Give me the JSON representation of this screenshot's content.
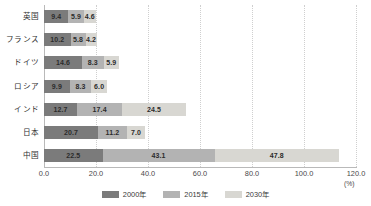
{
  "chart_data": {
    "type": "bar",
    "orientation": "horizontal",
    "stacked": true,
    "title": "",
    "xlabel": "(%)",
    "ylabel": "",
    "xlim": [
      0,
      120
    ],
    "xticks": [
      "0.0",
      "20.0",
      "40.0",
      "60.0",
      "80.0",
      "100.0",
      "120.0"
    ],
    "xtick_values": [
      0,
      20,
      40,
      60,
      80,
      100,
      120
    ],
    "grid": true,
    "legend_position": "bottom",
    "categories": [
      "英国",
      "フランス",
      "ドイツ",
      "ロシア",
      "インド",
      "日本",
      "中国"
    ],
    "series": [
      {
        "name": "2000年",
        "color": "#7b7b7b",
        "values": [
          9.4,
          10.2,
          14.6,
          9.9,
          12.7,
          20.7,
          22.5
        ],
        "labels": [
          "9.4",
          "10.2",
          "14.6",
          "9.9",
          "12.7",
          "20.7",
          "22.5"
        ]
      },
      {
        "name": "2015年",
        "color": "#b3b3b3",
        "values": [
          5.9,
          5.8,
          8.3,
          8.3,
          17.4,
          11.2,
          43.1
        ],
        "labels": [
          "5.9",
          "5.8",
          "8.3",
          "8.3",
          "17.4",
          "11.2",
          "43.1"
        ]
      },
      {
        "name": "2030年",
        "color": "#d8d7d2",
        "values": [
          4.6,
          4.2,
          5.9,
          6.0,
          24.5,
          7.0,
          47.8
        ],
        "labels": [
          "4.6",
          "4.2",
          "5.9",
          "6.0",
          "24.5",
          "7.0",
          "47.8"
        ]
      }
    ],
    "unit": "(%)"
  },
  "legend": {
    "items": [
      {
        "label": "2000年",
        "color": "#7b7b7b"
      },
      {
        "label": "2015年",
        "color": "#b3b3b3"
      },
      {
        "label": "2030年",
        "color": "#d8d7d2"
      }
    ]
  },
  "axis": {
    "unit": "(%)"
  }
}
